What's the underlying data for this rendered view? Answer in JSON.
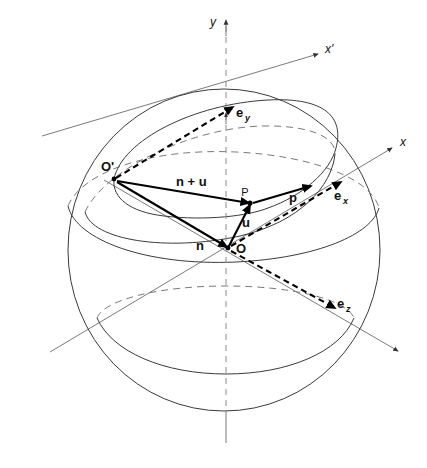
{
  "figure": {
    "background_color": "#ffffff",
    "stroke_color": "#3a3a3a",
    "vector_color": "#000000",
    "guide_color": "#7a7a7a"
  },
  "axes": [
    {
      "id": "y",
      "label": "y",
      "label_x": 213,
      "label_y": 26,
      "style": "italic"
    },
    {
      "id": "xp",
      "label": "x'",
      "label_x": 325,
      "label_y": 53,
      "style": "italic"
    },
    {
      "id": "x",
      "label": "x",
      "label_x": 400,
      "label_y": 146,
      "style": "italic"
    }
  ],
  "points": [
    {
      "id": "O",
      "label": "O",
      "x": 228,
      "y": 248,
      "label_x": 236,
      "label_y": 253,
      "weight": "bold",
      "size": 13
    },
    {
      "id": "Op",
      "label": "O'",
      "x": 114,
      "y": 179,
      "label_x": 101,
      "label_y": 171,
      "weight": "bold",
      "size": 13
    },
    {
      "id": "P",
      "label": "P",
      "x": 250,
      "y": 203,
      "label_x": 245,
      "label_y": 196,
      "weight": "normal",
      "size": 11
    }
  ],
  "vectors": [
    {
      "id": "n-plus-u",
      "label": "n + u",
      "label_x": 176,
      "label_y": 186,
      "style": "solid",
      "from": "O'",
      "to": "P"
    },
    {
      "id": "n",
      "label": "n",
      "label_x": 200,
      "label_y": 250,
      "style": "solid",
      "from": "O'",
      "to": "O"
    },
    {
      "id": "u",
      "label": "u",
      "label_x": 246,
      "label_y": 227,
      "style": "solid",
      "from": "O",
      "to": "P"
    },
    {
      "id": "p",
      "label": "p",
      "label_x": 293,
      "label_y": 202,
      "style": "solid",
      "from": "P",
      "to": "tip"
    },
    {
      "id": "e-y",
      "label": "e",
      "sub": "y",
      "label_x": 236,
      "label_y": 117,
      "style": "dashed",
      "from": "O'",
      "to": "tip"
    },
    {
      "id": "e-x",
      "label": "e",
      "sub": "x",
      "label_x": 334,
      "label_y": 200,
      "style": "dashed",
      "from": "O",
      "to": "tip"
    },
    {
      "id": "e-z",
      "label": "e",
      "sub": "z",
      "label_x": 337,
      "label_y": 308,
      "style": "dashed",
      "from": "O",
      "to": "tip"
    }
  ]
}
